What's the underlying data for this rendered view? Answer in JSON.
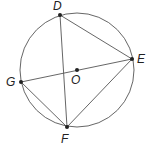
{
  "diagram": {
    "type": "inscribed-circle-geometry",
    "circle": {
      "center": "O",
      "cx": 77,
      "cy": 70,
      "r": 57,
      "stroke": "#555555"
    },
    "points": [
      {
        "id": "D",
        "label": "D",
        "x": 60,
        "y": 15,
        "lx": 53,
        "ly": 10
      },
      {
        "id": "E",
        "label": "E",
        "x": 132,
        "y": 59,
        "lx": 137,
        "ly": 63
      },
      {
        "id": "G",
        "label": "G",
        "x": 21,
        "y": 82,
        "lx": 6,
        "ly": 86
      },
      {
        "id": "F",
        "label": "F",
        "x": 67,
        "y": 127,
        "lx": 61,
        "ly": 143
      },
      {
        "id": "O",
        "label": "O",
        "x": 77,
        "y": 70,
        "lx": 71,
        "ly": 84
      }
    ],
    "segments": [
      {
        "from": "D",
        "to": "F"
      },
      {
        "from": "D",
        "to": "E"
      },
      {
        "from": "G",
        "to": "E"
      },
      {
        "from": "G",
        "to": "F"
      },
      {
        "from": "F",
        "to": "E"
      }
    ],
    "line_color": "#555555",
    "point_color": "#222222"
  }
}
